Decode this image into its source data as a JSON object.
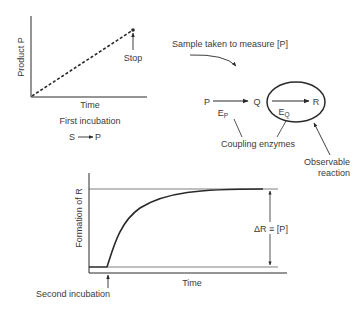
{
  "panel_first": {
    "ylabel": "Product P",
    "xlabel": "Time",
    "caption": "First incubation",
    "reaction": {
      "from": "S",
      "to": "P"
    },
    "stop_label": "Stop"
  },
  "sample_note": "Sample taken to measure [P]",
  "coupling": {
    "species": [
      "P",
      "Q",
      "R"
    ],
    "enzyme_p": {
      "main": "E",
      "sub": "P"
    },
    "enzyme_q": {
      "main": "E",
      "sub": "Q"
    },
    "coupling_label": "Coupling enzymes",
    "observable_line1": "Observable",
    "observable_line2": "reaction"
  },
  "panel_second": {
    "ylabel": "Formation of R",
    "xlabel": "Time",
    "caption": "Second incubation",
    "delta_label": "ΔR ≡ [P]"
  },
  "colors": {
    "ink": "#2a2a2a",
    "text": "#3a3a3a",
    "background": "#ffffff"
  }
}
